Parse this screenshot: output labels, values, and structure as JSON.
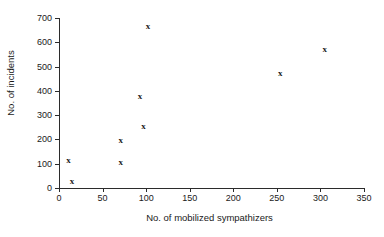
{
  "chart_data": {
    "type": "scatter",
    "title": "",
    "subtitle": "",
    "xlabel": "No. of mobilized sympathizers",
    "ylabel": "No. of incidents",
    "xlim": [
      0,
      350
    ],
    "ylim": [
      0,
      700
    ],
    "grid": false,
    "legend": null,
    "marker": "x",
    "marker_color": "#1a1a1a",
    "xticks": [
      0,
      50,
      100,
      150,
      200,
      250,
      300,
      350
    ],
    "yticks": [
      0,
      100,
      200,
      300,
      400,
      500,
      600,
      700
    ],
    "xtick_labels": [
      "0",
      "50",
      "100",
      "150",
      "200",
      "250",
      "300",
      "350"
    ],
    "ytick_labels": [
      "0",
      "100",
      "200",
      "300",
      "400",
      "500",
      "600",
      "700"
    ],
    "series": [
      {
        "name": "incidents",
        "points": [
          {
            "x": 11,
            "y": 111
          },
          {
            "x": 15,
            "y": 25
          },
          {
            "x": 71,
            "y": 103
          },
          {
            "x": 71,
            "y": 193
          },
          {
            "x": 93,
            "y": 375
          },
          {
            "x": 97,
            "y": 251
          },
          {
            "x": 102,
            "y": 663
          },
          {
            "x": 254,
            "y": 469
          },
          {
            "x": 305,
            "y": 568
          }
        ]
      }
    ]
  },
  "axes": {
    "x_title": "No. of mobilized sympathizers",
    "y_title": "No. of incidents"
  }
}
